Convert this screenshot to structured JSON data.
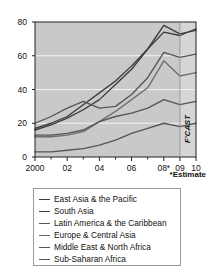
{
  "chart_data": {
    "type": "line",
    "title": "",
    "xlabel": "",
    "ylabel": "",
    "x": [
      "2000",
      "01",
      "02",
      "03",
      "04",
      "05",
      "06",
      "07",
      "08*",
      "09",
      "10"
    ],
    "xtick_labels": [
      "2000",
      "02",
      "04",
      "06",
      "08*",
      "09",
      "10"
    ],
    "ytick_labels": [
      "0",
      "20",
      "40",
      "60",
      "80"
    ],
    "ylim": [
      0,
      80
    ],
    "yticks": [
      0,
      20,
      40,
      60,
      80
    ],
    "grid": "horizontal",
    "legend_position": "below",
    "forecast_note": "*Estimate",
    "forecast_band_label": "F'CAST",
    "forecast_band_start": "09",
    "series": [
      {
        "name": "East Asia & the Pacific",
        "values": [
          17,
          20,
          24,
          31,
          38,
          45,
          54,
          64,
          74,
          72,
          76
        ]
      },
      {
        "name": "South Asia",
        "values": [
          16,
          19,
          23,
          28,
          34,
          43,
          52,
          64,
          78,
          73,
          75
        ]
      },
      {
        "name": "Latin America & the Caribbean",
        "values": [
          20,
          24,
          29,
          33,
          29,
          30,
          37,
          47,
          62,
          59,
          61
        ]
      },
      {
        "name": "Europe & Central Asia",
        "values": [
          12,
          12,
          13,
          15,
          21,
          27,
          34,
          41,
          57,
          48,
          50
        ]
      },
      {
        "name": "Middle East & North Africa",
        "values": [
          13,
          13,
          14,
          16,
          21,
          24,
          26,
          29,
          34,
          31,
          33
        ]
      },
      {
        "name": "Sub-Saharan Africa",
        "values": [
          3,
          3,
          4,
          5,
          7,
          10,
          14,
          17,
          20,
          18,
          20
        ]
      }
    ],
    "colors": {
      "plot_background": "#c9c9c9",
      "forecast_background": "#d6d6d6",
      "gridline": "#f2f2f2",
      "axis": "#222222",
      "line_dark": "#3c3c3c",
      "line_mid": "#555555",
      "line_light": "#6e6e6e"
    }
  }
}
